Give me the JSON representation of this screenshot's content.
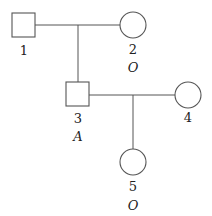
{
  "diagram": {
    "type": "pedigree",
    "individuals": [
      {
        "id": "1",
        "sex": "male",
        "blood_type": ""
      },
      {
        "id": "2",
        "sex": "female",
        "blood_type": "O"
      },
      {
        "id": "3",
        "sex": "male",
        "blood_type": "A"
      },
      {
        "id": "4",
        "sex": "female",
        "blood_type": ""
      },
      {
        "id": "5",
        "sex": "female",
        "blood_type": "O"
      }
    ],
    "matings": [
      {
        "partners": [
          "1",
          "2"
        ],
        "children": [
          "3"
        ]
      },
      {
        "partners": [
          "3",
          "4"
        ],
        "children": [
          "5"
        ]
      }
    ]
  },
  "labels": {
    "p1": "1",
    "p2": "2",
    "p2_type": "O",
    "p3": "3",
    "p3_type": "A",
    "p4": "4",
    "p5": "5",
    "p5_type": "O"
  },
  "colors": {
    "stroke": "#555555",
    "text": "#222222",
    "background": "#ffffff"
  }
}
